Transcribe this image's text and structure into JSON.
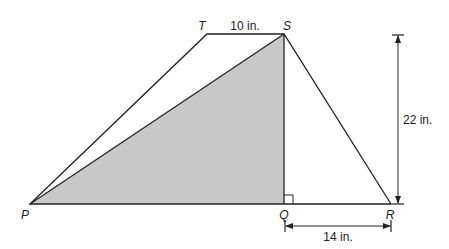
{
  "figure": {
    "type": "trapezoid-with-shaded-triangle",
    "vertices": {
      "P": {
        "label": "P",
        "x": 30,
        "y": 204
      },
      "Q": {
        "label": "Q",
        "x": 284,
        "y": 204
      },
      "R": {
        "label": "R",
        "x": 391,
        "y": 204
      },
      "S": {
        "label": "S",
        "x": 284,
        "y": 34
      },
      "T": {
        "label": "T",
        "x": 207,
        "y": 34
      }
    },
    "shaded_region": "triangle PQS",
    "right_angle_at": "Q",
    "measurements": {
      "TS": "10 in.",
      "SQ_height": "22 in.",
      "QR": "14 in."
    },
    "colors": {
      "stroke": "#222222",
      "shade": "#c8c8c8",
      "background": "#ffffff"
    }
  }
}
